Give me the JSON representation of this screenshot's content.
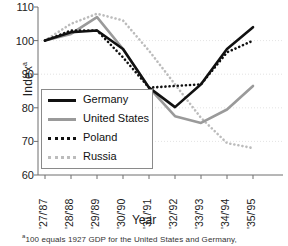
{
  "chart_data": {
    "type": "line",
    "title": "",
    "xlabel": "Year",
    "ylabel": "Index",
    "ylabel_superscript": "a",
    "ylim": [
      60,
      110
    ],
    "yticks": [
      110,
      100,
      90,
      80,
      70,
      60
    ],
    "grid": true,
    "legend_position": "inside-left",
    "categories": [
      "'27/'87",
      "'28/'88",
      "'29/'89",
      "'30/'90",
      "'31/'91",
      "'32/'92",
      "'33/'93",
      "'34/'94",
      "'35/'95"
    ],
    "series": [
      {
        "name": "Germany",
        "color": "#111111",
        "style": "solid",
        "width": 2.6,
        "values": [
          100.0,
          102.5,
          103.0,
          97.5,
          86.0,
          80.2,
          87.0,
          97.5,
          104.0
        ]
      },
      {
        "name": "United States",
        "color": "#9a9a9a",
        "style": "solid",
        "width": 2.6,
        "values": [
          100.0,
          102.0,
          107.0,
          97.5,
          86.0,
          77.5,
          75.5,
          79.5,
          86.5
        ]
      },
      {
        "name": "Poland",
        "color": "#111111",
        "style": "dotted",
        "width": 2.6,
        "values": [
          100.0,
          103.0,
          103.0,
          95.0,
          86.0,
          86.5,
          87.0,
          96.5,
          100.0
        ]
      },
      {
        "name": "Russia",
        "color": "#bcbcbc",
        "style": "dotted",
        "width": 2.6,
        "values": [
          100.0,
          105.0,
          108.0,
          106.0,
          97.0,
          87.0,
          77.0,
          69.5,
          68.0
        ]
      }
    ],
    "footnote": "100 equals 1927 GDP for the United States and Germany,",
    "footnote_marker": "a"
  }
}
